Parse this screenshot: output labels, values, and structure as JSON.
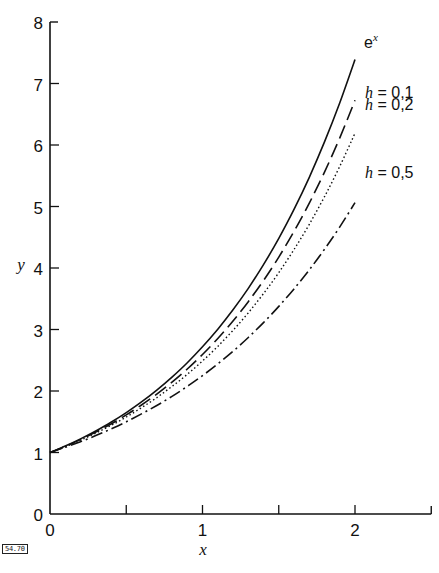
{
  "chart_data": {
    "type": "line",
    "title": "",
    "xlabel": "x",
    "ylabel": "y",
    "xlim": [
      0,
      2.5
    ],
    "ylim": [
      0,
      8
    ],
    "grid": false,
    "legend": "inline labels at right end of curves",
    "x_ticks": [
      0,
      0.5,
      1,
      1.5,
      2
    ],
    "x_tick_labels": [
      "0",
      "",
      "1",
      "",
      "2"
    ],
    "y_ticks": [
      0,
      1,
      2,
      3,
      4,
      5,
      6,
      7,
      8
    ],
    "y_tick_labels": [
      "0",
      "1",
      "2",
      "3",
      "4",
      "5",
      "6",
      "7",
      "8"
    ],
    "x": [
      0,
      0.1,
      0.2,
      0.3,
      0.4,
      0.5,
      0.6,
      0.7,
      0.8,
      0.9,
      1.0,
      1.1,
      1.2,
      1.3,
      1.4,
      1.5,
      1.6,
      1.7,
      1.8,
      1.9,
      2.0
    ],
    "series": [
      {
        "name": "e^x",
        "label_base": "e",
        "label_sup": "x",
        "style": "solid",
        "values": [
          1,
          1.105,
          1.221,
          1.35,
          1.492,
          1.649,
          1.822,
          2.014,
          2.226,
          2.46,
          2.718,
          3.004,
          3.32,
          3.669,
          4.055,
          4.482,
          4.953,
          5.474,
          6.05,
          6.686,
          7.389
        ]
      },
      {
        "name": "h = 0,1",
        "label_h": "h",
        "label_rest": " = 0,1",
        "style": "dashed",
        "values": [
          1,
          1.1,
          1.21,
          1.331,
          1.464,
          1.611,
          1.772,
          1.949,
          2.144,
          2.358,
          2.594,
          2.853,
          3.138,
          3.452,
          3.797,
          4.177,
          4.595,
          5.054,
          5.56,
          6.116,
          6.727
        ]
      },
      {
        "name": "h = 0,2",
        "label_h": "h",
        "label_rest": " = 0,2",
        "style": "dotted",
        "values": [
          1,
          1.095,
          1.2,
          1.315,
          1.44,
          1.577,
          1.728,
          1.893,
          2.074,
          2.271,
          2.488,
          2.726,
          2.986,
          3.271,
          3.583,
          3.925,
          4.3,
          4.711,
          5.16,
          5.653,
          6.192
        ]
      },
      {
        "name": "h = 0,5",
        "label_h": "h",
        "label_rest": " = 0,5",
        "style": "dashdot",
        "values": [
          1,
          1.084,
          1.176,
          1.275,
          1.383,
          1.5,
          1.627,
          1.764,
          1.913,
          2.075,
          2.25,
          2.44,
          2.646,
          2.87,
          3.112,
          3.375,
          3.66,
          3.969,
          4.305,
          4.668,
          5.063
        ]
      }
    ]
  },
  "figure_id": "54.70"
}
